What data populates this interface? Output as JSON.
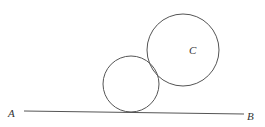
{
  "diagram": {
    "line": {
      "start_label": "A",
      "end_label": "B",
      "x1": 24,
      "y1": 111,
      "x2": 244,
      "y2": 114
    },
    "circles": [
      {
        "name": "small-circle",
        "label": "",
        "cx": 131,
        "cy": 84,
        "r": 28
      },
      {
        "name": "large-circle",
        "label": "C",
        "cx": 183,
        "cy": 50,
        "r": 36
      }
    ],
    "labels": {
      "a": "A",
      "b": "B",
      "c": "C"
    },
    "colors": {
      "stroke": "#555555",
      "text": "#333333",
      "background": "#ffffff"
    }
  }
}
